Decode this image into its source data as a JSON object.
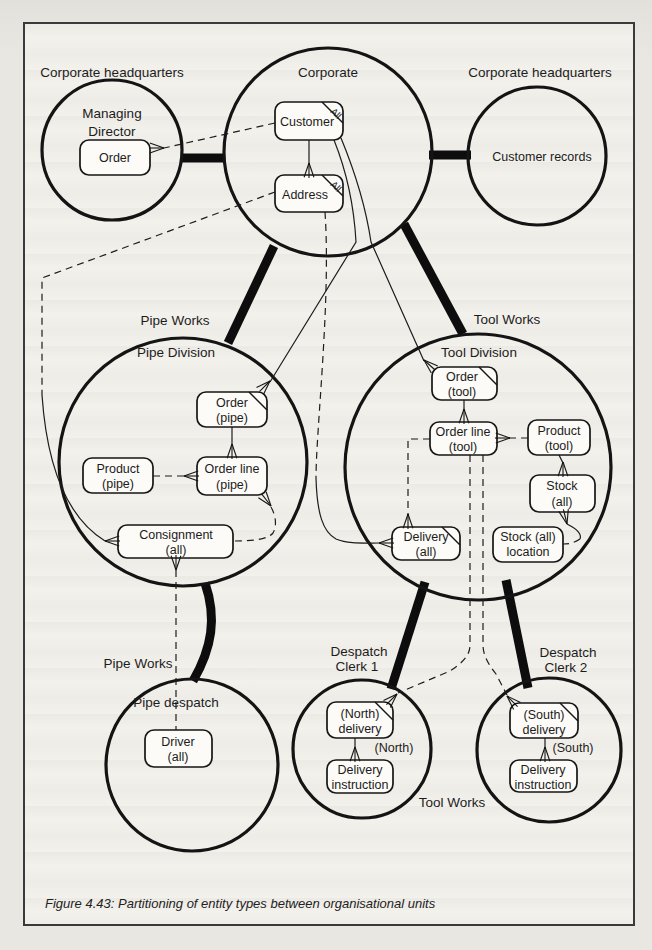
{
  "caption": "Figure 4.43: Partitioning of entity types between organisational units",
  "units": {
    "managing_director": {
      "region_label": "Corporate headquarters",
      "name1": "Managing",
      "name2": "Director",
      "order": "Order"
    },
    "corporate": {
      "name": "Corporate",
      "customer": "Customer",
      "customer_tag": "All",
      "address": "Address",
      "address_tag": "All"
    },
    "customer_records": {
      "region_label": "Corporate headquarters",
      "records": "Customer records"
    },
    "pipe_division": {
      "region_label": "Pipe Works",
      "name": "Pipe Division",
      "order1": "Order",
      "order2": "(pipe)",
      "product1": "Product",
      "product2": "(pipe)",
      "order_line1": "Order line",
      "order_line2": "(pipe)",
      "consignment1": "Consignment",
      "consignment2": "(all)"
    },
    "tool_division": {
      "region_label": "Tool Works",
      "name": "Tool Division",
      "order1": "Order",
      "order2": "(tool)",
      "order_line1": "Order line",
      "order_line2": "(tool)",
      "product1": "Product",
      "product2": "(tool)",
      "stock1": "Stock",
      "stock2": "(all)",
      "stock_location1": "Stock (all)",
      "stock_location2": "location",
      "delivery1": "Delivery",
      "delivery2": "(all)"
    },
    "pipe_despatch": {
      "region_label": "Pipe Works",
      "name": "Pipe despatch",
      "driver1": "Driver",
      "driver2": "(all)"
    },
    "despatch_clerk_1": {
      "region_label1": "Despatch",
      "region_label2": "Clerk 1",
      "delivery1": "(North)",
      "delivery2": "delivery",
      "rel_label": "(North)",
      "instruction1": "Delivery",
      "instruction2": "instruction"
    },
    "despatch_clerk_2": {
      "region_label1": "Despatch",
      "region_label2": "Clerk 2",
      "delivery1": "(South)",
      "delivery2": "delivery",
      "rel_label": "(South)",
      "instruction1": "Delivery",
      "instruction2": "instruction"
    },
    "tool_works_note": "Tool Works"
  },
  "colors": {
    "ink": "#161616",
    "paper": "#f3f1ec",
    "page": "#e8e6e1"
  }
}
